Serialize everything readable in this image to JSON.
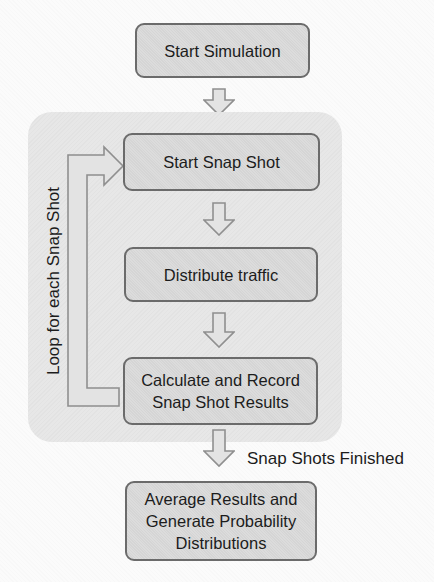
{
  "diagram": {
    "type": "flowchart",
    "nodes": {
      "start_simulation": {
        "label": "Start Simulation"
      },
      "start_snap_shot": {
        "label": "Start Snap Shot"
      },
      "distribute_traffic": {
        "label": "Distribute traffic"
      },
      "calculate_record": {
        "label": "Calculate and Record Snap Shot Results",
        "lines": [
          "Calculate and Record",
          "Snap Shot Results"
        ]
      },
      "average_results": {
        "label": "Average Results and Generate Probability Distributions",
        "lines": [
          "Average Results and",
          "Generate Probability",
          "Distributions"
        ]
      }
    },
    "labels": {
      "loop": "Loop for each Snap Shot",
      "snap_shots_finished": "Snap Shots Finished"
    },
    "edges": [
      {
        "from": "start_simulation",
        "to": "start_snap_shot"
      },
      {
        "from": "start_snap_shot",
        "to": "distribute_traffic"
      },
      {
        "from": "distribute_traffic",
        "to": "calculate_record"
      },
      {
        "from": "calculate_record",
        "to": "average_results",
        "label": "Snap Shots Finished"
      },
      {
        "from": "calculate_record",
        "to": "start_snap_shot",
        "label": "Loop for each Snap Shot"
      }
    ],
    "colors": {
      "background": "#fbfbfb",
      "container_fill": "#e7e7e7",
      "node_fill": "#dcdcdc",
      "node_border": "#6b6b6b",
      "arrow_fill": "#e3e3e3",
      "arrow_stroke": "#8f8f8f",
      "text": "#1c1c1c"
    }
  }
}
